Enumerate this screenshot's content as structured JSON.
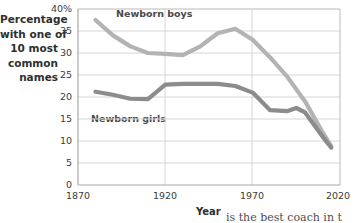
{
  "chart_data": {
    "type": "line",
    "title": "",
    "xlabel": "Year",
    "ylabel": "Percentage with one of 10 most common names",
    "xlim": [
      1870,
      2020
    ],
    "ylim": [
      0,
      40
    ],
    "grid": true,
    "legend_position": "inline-labels",
    "xticks": [
      "1870",
      "1920",
      "1970",
      "2020"
    ],
    "xtick_values": [
      1870,
      1920,
      1970,
      2020
    ],
    "yticks": [
      "0",
      "5",
      "10",
      "15",
      "20",
      "25",
      "30",
      "35",
      "40%"
    ],
    "ytick_values": [
      0,
      5,
      10,
      15,
      20,
      25,
      30,
      35,
      40
    ],
    "series": [
      {
        "name": "Newborn boys",
        "color": "#b3b3b3",
        "x": [
          1880,
          1890,
          1900,
          1910,
          1920,
          1930,
          1940,
          1945,
          1950,
          1960,
          1970,
          1980,
          1990,
          2000,
          2010,
          2015
        ],
        "values": [
          37.5,
          34.0,
          31.5,
          30.0,
          29.8,
          29.5,
          31.5,
          33.0,
          34.5,
          35.5,
          33.0,
          29.0,
          24.5,
          19.0,
          12.0,
          8.8
        ]
      },
      {
        "name": "Newborn girls",
        "color": "#8c8c8c",
        "x": [
          1880,
          1890,
          1900,
          1910,
          1920,
          1930,
          1940,
          1950,
          1960,
          1970,
          1980,
          1990,
          1995,
          2000,
          2010,
          2015
        ],
        "values": [
          21.2,
          20.5,
          19.6,
          19.5,
          22.8,
          23.0,
          23.0,
          23.0,
          22.5,
          21.0,
          17.0,
          16.8,
          17.5,
          16.5,
          11.0,
          8.5
        ]
      }
    ],
    "annotations": [
      {
        "text": "Newborn boys",
        "x": 1930,
        "y": 38.5
      },
      {
        "text": "Newborn girls",
        "x": 1897,
        "y": 17.5
      }
    ]
  },
  "axis_titles": {
    "y_lines": [
      "Percentage",
      "with one of",
      "10 most",
      "common",
      "names"
    ],
    "x": "Year"
  },
  "caption_fragment": "is the best coach in t",
  "colors": {
    "boys_line": "#b3b3b3",
    "girls_line": "#8c8c8c",
    "grid": "#d0d0d0",
    "axis": "#9a9a9a",
    "text": "#3a3a3a"
  }
}
